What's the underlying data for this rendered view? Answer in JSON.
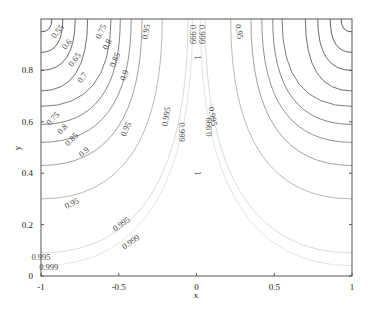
{
  "chart_data": {
    "type": "contour",
    "title": "",
    "xlabel": "x",
    "ylabel": "y",
    "xlim": [
      -1,
      1
    ],
    "ylim": [
      0,
      1
    ],
    "x_ticks": [
      "-1",
      "-0.5",
      "0",
      "0.5",
      "1"
    ],
    "x_tick_values": [
      -1,
      -0.5,
      0,
      0.5,
      1
    ],
    "y_ticks": [
      "0",
      "0.2",
      "0.4",
      "0.6",
      "0.8"
    ],
    "y_tick_values": [
      0,
      0.2,
      0.4,
      0.6,
      0.8
    ],
    "grid": false,
    "legend": null,
    "symmetric_about_x0": true,
    "levels": [
      {
        "value": "0.55",
        "edge_y": 0.95,
        "top_x": -0.93,
        "color": "#333333"
      },
      {
        "value": "0.6",
        "edge_y": 0.87,
        "top_x": -0.86,
        "color": "#3a3a3a"
      },
      {
        "value": "0.65",
        "edge_y": 0.8,
        "top_x": -0.78,
        "color": "#444444"
      },
      {
        "value": "0.7",
        "edge_y": 0.72,
        "top_x": -0.7,
        "color": "#4d4d4d"
      },
      {
        "value": "0.75",
        "edge_y": 0.66,
        "top_x": -0.55,
        "color": "#5a5a5a"
      },
      {
        "value": "0.8",
        "edge_y": 0.59,
        "top_x": -0.49,
        "color": "#666666"
      },
      {
        "value": "0.85",
        "edge_y": 0.52,
        "top_x": -0.42,
        "color": "#777777"
      },
      {
        "value": "0.9",
        "edge_y": 0.43,
        "top_x": -0.35,
        "color": "#8a8a8a"
      },
      {
        "value": "0.95",
        "edge_y": 0.3,
        "top_x": -0.22,
        "color": "#a8a8a8"
      },
      {
        "value": "0.995",
        "edge_y": 0.09,
        "top_x": -0.055,
        "color": "#d0d0d0"
      },
      {
        "value": "0.999",
        "edge_y": 0.04,
        "top_x": -0.025,
        "color": "#dedede"
      }
    ],
    "center_label": "1",
    "labels": [
      {
        "text": "0.55",
        "x": -0.89,
        "y": 0.95,
        "angle": -50
      },
      {
        "text": "0.6",
        "x": -0.83,
        "y": 0.9,
        "angle": -50
      },
      {
        "text": "0.65",
        "x": -0.78,
        "y": 0.84,
        "angle": -52
      },
      {
        "text": "0.7",
        "x": -0.73,
        "y": 0.77,
        "angle": -55
      },
      {
        "text": "0.75",
        "x": -0.61,
        "y": 0.95,
        "angle": -65
      },
      {
        "text": "0.8",
        "x": -0.57,
        "y": 0.9,
        "angle": -62
      },
      {
        "text": "0.85",
        "x": -0.52,
        "y": 0.84,
        "angle": -66
      },
      {
        "text": "0.9",
        "x": -0.46,
        "y": 0.78,
        "angle": -70
      },
      {
        "text": "0.95",
        "x": -0.32,
        "y": 0.95,
        "angle": -80
      },
      {
        "text": "0.999",
        "x": -0.03,
        "y": 0.94,
        "angle": 90
      },
      {
        "text": "0.999",
        "x": 0.03,
        "y": 0.94,
        "angle": 90
      },
      {
        "text": "0.95",
        "x": 0.27,
        "y": 0.95,
        "angle": 80
      },
      {
        "text": "0.75",
        "x": -0.92,
        "y": 0.61,
        "angle": -45
      },
      {
        "text": "0.8",
        "x": -0.86,
        "y": 0.57,
        "angle": -45
      },
      {
        "text": "0.85",
        "x": -0.8,
        "y": 0.53,
        "angle": -45
      },
      {
        "text": "0.9",
        "x": -0.72,
        "y": 0.48,
        "angle": -40
      },
      {
        "text": "0.95",
        "x": -0.45,
        "y": 0.57,
        "angle": -65
      },
      {
        "text": "0.995",
        "x": -0.19,
        "y": 0.62,
        "angle": -80
      },
      {
        "text": "0.999",
        "x": -0.1,
        "y": 0.56,
        "angle": 90
      },
      {
        "text": "0.995",
        "x": 0.1,
        "y": 0.62,
        "angle": 80
      },
      {
        "text": "0.999",
        "x": 0.09,
        "y": 0.58,
        "angle": -90
      },
      {
        "text": "0.95",
        "x": -0.8,
        "y": 0.28,
        "angle": -25
      },
      {
        "text": "0.995",
        "x": -0.48,
        "y": 0.2,
        "angle": -35
      },
      {
        "text": "0.999",
        "x": -0.42,
        "y": 0.13,
        "angle": -35
      },
      {
        "text": "0.995",
        "x": -1.0,
        "y": 0.07,
        "angle": 0
      },
      {
        "text": "0.999",
        "x": -0.95,
        "y": 0.03,
        "angle": 0
      }
    ]
  },
  "axes": {
    "x_label": "x",
    "y_label": "y"
  }
}
